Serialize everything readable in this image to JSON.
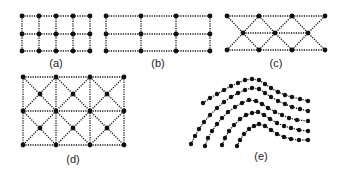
{
  "figure": {
    "background": "#ffffff",
    "ink_color": "#111111",
    "panels": [
      {
        "id": "a",
        "label": "(a)",
        "label_pos": [
          56,
          67
        ],
        "description": "Regular rectangular grid, 5 columns x 3 rows",
        "cols_x": [
          22,
          39,
          56,
          73,
          90
        ],
        "rows_y": [
          16,
          34,
          51
        ]
      },
      {
        "id": "b",
        "label": "(b)",
        "label_pos": [
          158,
          67
        ],
        "description": "Coarser rectangular grid, 4 columns x 3 rows",
        "cols_x": [
          106,
          141,
          176,
          210
        ],
        "rows_y": [
          16,
          34,
          51
        ]
      },
      {
        "id": "c",
        "label": "(c)",
        "label_pos": [
          276,
          67
        ],
        "description": "Triangular mesh: 4 top nodes, 3 offset middle nodes, 4 bottom nodes",
        "top": [
          [
            227,
            16
          ],
          [
            259,
            16
          ],
          [
            292,
            16
          ],
          [
            325,
            16
          ]
        ],
        "middle": [
          [
            243,
            33
          ],
          [
            275,
            33
          ],
          [
            308,
            33
          ]
        ],
        "bottom": [
          [
            227,
            50
          ],
          [
            259,
            50
          ],
          [
            292,
            50
          ],
          [
            325,
            50
          ]
        ]
      },
      {
        "id": "d",
        "label": "(d)",
        "label_pos": [
          73,
          163
        ],
        "description": "Rectangular grid 4x3 with cell-center nodes and diagonals",
        "cols_x": [
          23,
          56,
          90,
          124
        ],
        "rows_y": [
          77,
          111,
          145
        ],
        "centers_x": [
          40,
          73,
          107
        ],
        "centers_y": [
          94,
          128
        ]
      },
      {
        "id": "e",
        "label": "(e)",
        "label_pos": [
          261,
          160
        ],
        "description": "Five curved, roughly parallel chains of dots (streamline-like)",
        "curves": [
          [
            [
              203,
              103
            ],
            [
              210,
              98
            ],
            [
              217,
              94
            ],
            [
              224,
              90
            ],
            [
              231,
              86
            ],
            [
              238,
              83
            ],
            [
              245,
              80
            ],
            [
              252,
              79
            ],
            [
              259,
              80
            ],
            [
              265,
              84
            ],
            [
              271,
              88
            ],
            [
              278,
              92
            ],
            [
              285,
              95
            ],
            [
              292,
              97
            ],
            [
              300,
              99
            ],
            [
              308,
              101
            ]
          ],
          [
            [
              191,
              144
            ],
            [
              195,
              136
            ],
            [
              199,
              129
            ],
            [
              204,
              122
            ],
            [
              210,
              115
            ],
            [
              217,
              108
            ],
            [
              224,
              102
            ],
            [
              231,
              97
            ],
            [
              238,
              93
            ],
            [
              245,
              90
            ],
            [
              252,
              88
            ],
            [
              259,
              89
            ],
            [
              265,
              93
            ],
            [
              271,
              97
            ],
            [
              278,
              101
            ],
            [
              285,
              104
            ],
            [
              292,
              107
            ],
            [
              300,
              109
            ],
            [
              308,
              111
            ]
          ],
          [
            [
              205,
              146
            ],
            [
              208,
              138
            ],
            [
              212,
              131
            ],
            [
              217,
              124
            ],
            [
              222,
              118
            ],
            [
              228,
              112
            ],
            [
              235,
              107
            ],
            [
              242,
              103
            ],
            [
              249,
              100
            ],
            [
              256,
              101
            ],
            [
              262,
              104
            ],
            [
              268,
              108
            ],
            [
              275,
              112
            ],
            [
              282,
              115
            ],
            [
              289,
              118
            ],
            [
              297,
              120
            ],
            [
              308,
              121
            ]
          ],
          [
            [
              222,
              145
            ],
            [
              225,
              138
            ],
            [
              229,
              131
            ],
            [
              234,
              125
            ],
            [
              240,
              119
            ],
            [
              246,
              115
            ],
            [
              252,
              113
            ],
            [
              258,
              112
            ],
            [
              264,
              115
            ],
            [
              270,
              119
            ],
            [
              277,
              123
            ],
            [
              284,
              126
            ],
            [
              291,
              128
            ],
            [
              299,
              130
            ],
            [
              308,
              131
            ]
          ],
          [
            [
              237,
              146
            ],
            [
              240,
              140
            ],
            [
              244,
              134
            ],
            [
              249,
              129
            ],
            [
              254,
              126
            ],
            [
              259,
              124
            ],
            [
              265,
              126
            ],
            [
              271,
              130
            ],
            [
              277,
              134
            ],
            [
              284,
              137
            ],
            [
              291,
              139
            ],
            [
              299,
              140
            ],
            [
              308,
              140
            ]
          ]
        ]
      }
    ]
  }
}
